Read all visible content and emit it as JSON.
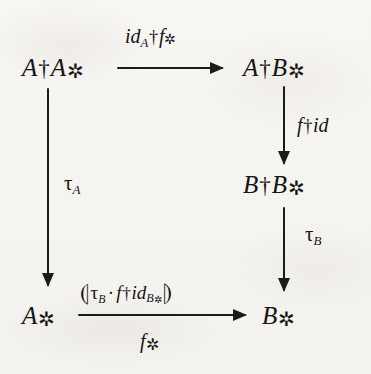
{
  "diagram": {
    "kind": "commutative-diagram",
    "nodes": {
      "top_left": "A†A⋆",
      "top_right": "A†B⋆",
      "mid_right": "B†B⋆",
      "bottom_left": "A⋆",
      "bottom_right": "B⋆"
    },
    "labels": {
      "top_arrow": "id_A † f⋆",
      "right_upper_arrow": "f † id",
      "right_lower_arrow": "τ_B",
      "left_arrow": "τ_A",
      "bottom_arrow_above": "⦇ τ_B · f † id_{B⋆} ⦈",
      "bottom_arrow_below": "f⋆"
    },
    "glyphs": {
      "dagger": "†",
      "star": "⋆",
      "tau": "τ",
      "cdot": "·",
      "banana_left": "⦇",
      "banana_right": "⦈"
    },
    "arrows": [
      {
        "name": "top",
        "from": "top_left",
        "to": "top_right",
        "direction": "right"
      },
      {
        "name": "left",
        "from": "top_left",
        "to": "bottom_left",
        "direction": "down"
      },
      {
        "name": "right-upper",
        "from": "top_right",
        "to": "mid_right",
        "direction": "down"
      },
      {
        "name": "right-lower",
        "from": "mid_right",
        "to": "bottom_right",
        "direction": "down"
      },
      {
        "name": "bottom",
        "from": "bottom_left",
        "to": "bottom_right",
        "direction": "right"
      }
    ],
    "colors": {
      "ink": "#1a1a1a",
      "paper": "#f7f5f2"
    }
  }
}
